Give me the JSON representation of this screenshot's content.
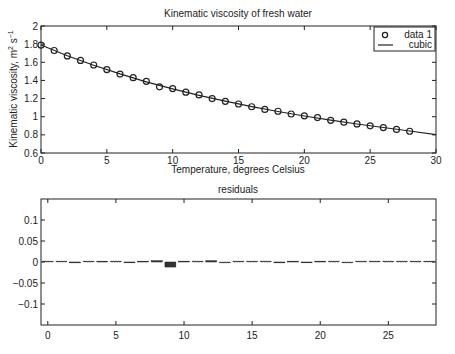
{
  "chart_data": [
    {
      "type": "scatter",
      "title": "Kinematic viscosity of fresh water",
      "xlabel": "Temperature, degrees Celsius",
      "ylabel": "Kinematic viscosity, m² s⁻¹",
      "xlim": [
        0,
        30
      ],
      "ylim": [
        0.6,
        2
      ],
      "xticks": [
        0,
        5,
        10,
        15,
        20,
        25,
        30
      ],
      "yticks": [
        0.6,
        0.8,
        1,
        1.2,
        1.4,
        1.6,
        1.8,
        2
      ],
      "ytick_labels": [
        "0.6",
        "0.8",
        "1",
        "1.2",
        "1.4",
        "1.6",
        "1.8",
        "2"
      ],
      "grid": false,
      "legend_position": "top-right",
      "legend": [
        "data 1",
        "cubic"
      ],
      "series": [
        {
          "name": "data 1",
          "marker": "circle",
          "x": [
            0,
            1,
            2,
            3,
            4,
            5,
            6,
            7,
            8,
            9,
            10,
            11,
            12,
            13,
            14,
            15,
            16,
            17,
            18,
            19,
            20,
            21,
            22,
            23,
            24,
            25,
            26,
            27,
            28
          ],
          "values": [
            1.79,
            1.73,
            1.67,
            1.62,
            1.57,
            1.52,
            1.47,
            1.43,
            1.39,
            1.33,
            1.31,
            1.27,
            1.24,
            1.2,
            1.17,
            1.14,
            1.11,
            1.08,
            1.06,
            1.03,
            1.01,
            0.99,
            0.96,
            0.94,
            0.92,
            0.9,
            0.88,
            0.86,
            0.84
          ]
        },
        {
          "name": "cubic",
          "line": "solid",
          "x": [
            0,
            2,
            4,
            6,
            8,
            10,
            12,
            14,
            16,
            18,
            20,
            22,
            24,
            26,
            28,
            30
          ],
          "values": [
            1.79,
            1.672,
            1.568,
            1.472,
            1.385,
            1.307,
            1.236,
            1.172,
            1.112,
            1.058,
            1.008,
            0.962,
            0.92,
            0.881,
            0.843,
            0.803
          ]
        }
      ]
    },
    {
      "type": "bar",
      "title": "residuals",
      "xlabel": "",
      "ylabel": "",
      "xlim": [
        -0.5,
        28.5
      ],
      "ylim": [
        -0.15,
        0.15
      ],
      "xticks": [
        0,
        5,
        10,
        15,
        20,
        25
      ],
      "yticks": [
        -0.1,
        -0.05,
        0,
        0.05,
        0.1
      ],
      "ytick_labels": [
        "-0.1",
        "-0.05",
        "0",
        "0.05",
        "0.1"
      ],
      "grid": false,
      "categories": [
        0,
        1,
        2,
        3,
        4,
        5,
        6,
        7,
        8,
        9,
        10,
        11,
        12,
        13,
        14,
        15,
        16,
        17,
        18,
        19,
        20,
        21,
        22,
        23,
        24,
        25,
        26,
        27,
        28
      ],
      "values": [
        0.0005,
        0.0,
        -0.002,
        0.0,
        0.001,
        0.0005,
        -0.001,
        0.001,
        0.003,
        -0.012,
        0.002,
        0.0,
        0.003,
        -0.0005,
        0.0,
        0.0,
        0.0005,
        -0.002,
        0.002,
        -0.001,
        0.002,
        0.0005,
        -0.0005,
        0.0005,
        0.0005,
        0.0005,
        0.0005,
        0.0,
        0.0005
      ]
    }
  ],
  "labels": {
    "top_title": "Kinematic viscosity of fresh water",
    "top_xlabel": "Temperature, degrees Celsius",
    "top_ylabel": "Kinematic viscosity, m",
    "bottom_title": "residuals",
    "legend_data": "data 1",
    "legend_fit": "cubic"
  }
}
